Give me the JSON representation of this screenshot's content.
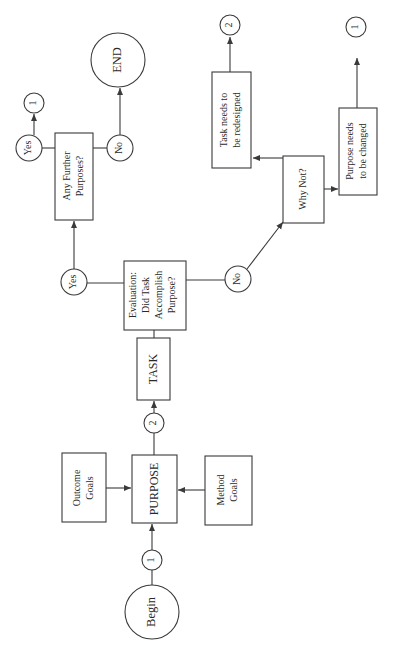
{
  "header": {
    "running_head": ""
  },
  "diagram": {
    "type": "flowchart",
    "orientation": "rotated-90-ccw",
    "nodes": {
      "begin": {
        "label": "Begin",
        "shape": "circle"
      },
      "connector_1_start": {
        "label": "1",
        "shape": "small-circle"
      },
      "outcome_goals": {
        "line1": "Outcome",
        "line2": "Goals",
        "shape": "rectangle"
      },
      "purpose": {
        "label": "PURPOSE",
        "shape": "rectangle"
      },
      "method_goals": {
        "line1": "Method",
        "line2": "Goals",
        "shape": "rectangle"
      },
      "connector_2_mid": {
        "label": "2",
        "shape": "small-circle"
      },
      "task": {
        "label": "TASK",
        "shape": "rectangle"
      },
      "evaluation": {
        "line1": "Evaluation:",
        "line2": "Did Task",
        "line3": "Accomplish",
        "line4": "Purpose?",
        "shape": "rectangle"
      },
      "eval_yes": {
        "label": "Yes",
        "shape": "small-circle"
      },
      "eval_no": {
        "label": "No",
        "shape": "small-circle"
      },
      "any_further": {
        "line1": "Any Further",
        "line2": "Purposes?",
        "shape": "rectangle"
      },
      "further_yes": {
        "label": "Yes",
        "shape": "small-circle"
      },
      "further_yes_connector_1": {
        "label": "1",
        "shape": "small-circle"
      },
      "further_no": {
        "label": "No",
        "shape": "small-circle"
      },
      "end": {
        "label": "END",
        "shape": "circle"
      },
      "why_not": {
        "label": "Why Not?",
        "shape": "rectangle"
      },
      "task_redesign": {
        "line1": "Task needs to",
        "line2": "be redesigned",
        "shape": "rectangle"
      },
      "task_redesign_connector_2": {
        "label": "2",
        "shape": "small-circle"
      },
      "purpose_change": {
        "line1": "Purpose needs",
        "line2": "to be changed",
        "shape": "rectangle"
      },
      "purpose_change_connector_1": {
        "label": "1",
        "shape": "small-circle"
      }
    },
    "edges": [
      {
        "from": "begin",
        "to": "connector_1_start"
      },
      {
        "from": "connector_1_start",
        "to": "purpose"
      },
      {
        "from": "outcome_goals",
        "to": "purpose"
      },
      {
        "from": "method_goals",
        "to": "purpose"
      },
      {
        "from": "purpose",
        "to": "connector_2_mid"
      },
      {
        "from": "connector_2_mid",
        "to": "task"
      },
      {
        "from": "task",
        "to": "evaluation"
      },
      {
        "from": "evaluation",
        "to": "eval_yes"
      },
      {
        "from": "evaluation",
        "to": "eval_no"
      },
      {
        "from": "eval_yes",
        "to": "any_further"
      },
      {
        "from": "any_further",
        "to": "further_yes"
      },
      {
        "from": "further_yes",
        "to": "further_yes_connector_1"
      },
      {
        "from": "any_further",
        "to": "further_no"
      },
      {
        "from": "further_no",
        "to": "end"
      },
      {
        "from": "eval_no",
        "to": "why_not"
      },
      {
        "from": "why_not",
        "to": "task_redesign"
      },
      {
        "from": "why_not",
        "to": "purpose_change"
      },
      {
        "from": "task_redesign",
        "to": "task_redesign_connector_2"
      },
      {
        "from": "purpose_change",
        "to": "purpose_change_connector_1"
      }
    ]
  },
  "colors": {
    "stroke": "#3a3a3a",
    "text": "#2a2a2a",
    "background": "#ffffff"
  }
}
